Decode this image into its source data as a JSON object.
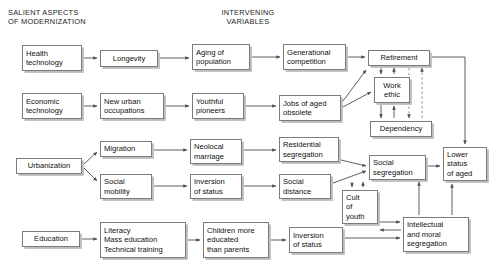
{
  "figure": {
    "type": "flowchart",
    "headers": [
      {
        "id": "salient",
        "text": "SALIENT ASPECTS\nOF MODERNIZATION",
        "x": 8,
        "y": 8,
        "align": "left"
      },
      {
        "id": "intervening",
        "text": "INTERVENING\nVARIABLES",
        "x": 196,
        "y": 8,
        "align": "center",
        "width": 104
      }
    ],
    "nodes": [
      {
        "id": "health-technology",
        "label": "Health\ntechnology",
        "x": 22,
        "y": 45,
        "w": 60,
        "h": 26,
        "align": "left",
        "column": "salient"
      },
      {
        "id": "longevity",
        "label": "Longevity",
        "x": 100,
        "y": 50,
        "w": 58,
        "h": 17,
        "align": "center",
        "column": "intervening"
      },
      {
        "id": "aging-of-population",
        "label": "Aging of\npopulation",
        "x": 192,
        "y": 44,
        "w": 58,
        "h": 26,
        "align": "left",
        "column": "intervening"
      },
      {
        "id": "generational-competition",
        "label": "Generational\ncompetition",
        "x": 283,
        "y": 44,
        "w": 63,
        "h": 26,
        "align": "left",
        "column": "intervening"
      },
      {
        "id": "retirement",
        "label": "Retirement",
        "x": 368,
        "y": 50,
        "w": 62,
        "h": 16,
        "align": "center",
        "column": "intervening"
      },
      {
        "id": "economic-technology",
        "label": "Economic\ntechnology",
        "x": 22,
        "y": 93,
        "w": 60,
        "h": 26,
        "align": "left",
        "column": "salient"
      },
      {
        "id": "new-urban-occupations",
        "label": "New urban\noccupations",
        "x": 100,
        "y": 93,
        "w": 64,
        "h": 26,
        "align": "left",
        "column": "intervening"
      },
      {
        "id": "youthful-pioneers",
        "label": "Youthful\npioneers",
        "x": 192,
        "y": 93,
        "w": 52,
        "h": 26,
        "align": "left",
        "column": "intervening"
      },
      {
        "id": "jobs-of-aged-obsolete",
        "label": "Jobs of aged\nobsolete",
        "x": 279,
        "y": 95,
        "w": 62,
        "h": 26,
        "align": "left",
        "column": "intervening"
      },
      {
        "id": "work-ethic",
        "label": "Work\nethic",
        "x": 374,
        "y": 77,
        "w": 36,
        "h": 26,
        "align": "center",
        "column": "intervening"
      },
      {
        "id": "dependency",
        "label": "Dependency",
        "x": 370,
        "y": 121,
        "w": 62,
        "h": 16,
        "align": "center",
        "column": "intervening"
      },
      {
        "id": "urbanization",
        "label": "Urbanization",
        "x": 16,
        "y": 158,
        "w": 66,
        "h": 16,
        "align": "center",
        "column": "salient"
      },
      {
        "id": "migration",
        "label": "Migration",
        "x": 100,
        "y": 141,
        "w": 52,
        "h": 16,
        "align": "left",
        "column": "intervening"
      },
      {
        "id": "neolocal-marriage",
        "label": "Neolocal\nmarriage",
        "x": 190,
        "y": 139,
        "w": 52,
        "h": 25,
        "align": "left",
        "column": "intervening"
      },
      {
        "id": "residential-segregation",
        "label": "Residential\nsegregation",
        "x": 279,
        "y": 137,
        "w": 60,
        "h": 25,
        "align": "left",
        "column": "intervening"
      },
      {
        "id": "social-segregation",
        "label": "Social\nsegregation",
        "x": 369,
        "y": 155,
        "w": 57,
        "h": 25,
        "align": "left",
        "column": "intervening"
      },
      {
        "id": "lower-status-of-aged",
        "label": "Lower\nstatus\nof aged",
        "x": 443,
        "y": 147,
        "w": 44,
        "h": 34,
        "align": "left",
        "column": "intervening"
      },
      {
        "id": "social-mobility",
        "label": "Social\nmobility",
        "x": 100,
        "y": 174,
        "w": 52,
        "h": 25,
        "align": "left",
        "column": "intervening"
      },
      {
        "id": "inversion-of-status-1",
        "label": "Inversion\nof status",
        "x": 190,
        "y": 174,
        "w": 52,
        "h": 25,
        "align": "left",
        "column": "intervening"
      },
      {
        "id": "social-distance",
        "label": "Social\ndistance",
        "x": 279,
        "y": 174,
        "w": 52,
        "h": 25,
        "align": "left",
        "column": "intervening"
      },
      {
        "id": "cult-of-youth",
        "label": "Cult\nof\nyouth",
        "x": 342,
        "y": 190,
        "w": 36,
        "h": 34,
        "align": "left",
        "column": "intervening"
      },
      {
        "id": "intellectual-moral-segregation",
        "label": "Intellectual\nand moral\nsegregation",
        "x": 403,
        "y": 217,
        "w": 66,
        "h": 35,
        "align": "left",
        "column": "intervening"
      },
      {
        "id": "education",
        "label": "Education",
        "x": 22,
        "y": 231,
        "w": 58,
        "h": 16,
        "align": "center",
        "column": "salient"
      },
      {
        "id": "literacy-block",
        "label": "Literacy\nMass education\nTechnical training",
        "x": 100,
        "y": 222,
        "w": 86,
        "h": 36,
        "align": "left",
        "column": "intervening"
      },
      {
        "id": "children-more-educated",
        "label": "Children more\neducated\nthan parents",
        "x": 203,
        "y": 222,
        "w": 66,
        "h": 36,
        "align": "left",
        "column": "intervening"
      },
      {
        "id": "inversion-of-status-2",
        "label": "Inversion\nof status",
        "x": 289,
        "y": 227,
        "w": 54,
        "h": 26,
        "align": "left",
        "column": "intervening"
      }
    ],
    "edges": [
      {
        "from": "health-technology",
        "to": "longevity",
        "style": "solid"
      },
      {
        "from": "longevity",
        "to": "aging-of-population",
        "style": "solid"
      },
      {
        "from": "aging-of-population",
        "to": "generational-competition",
        "style": "solid"
      },
      {
        "from": "generational-competition",
        "to": "retirement",
        "style": "solid"
      },
      {
        "from": "economic-technology",
        "to": "new-urban-occupations",
        "style": "solid"
      },
      {
        "from": "new-urban-occupations",
        "to": "youthful-pioneers",
        "style": "solid"
      },
      {
        "from": "youthful-pioneers",
        "to": "jobs-of-aged-obsolete",
        "style": "solid"
      },
      {
        "from": "jobs-of-aged-obsolete",
        "to": "retirement",
        "style": "solid"
      },
      {
        "from": "jobs-of-aged-obsolete",
        "to": "work-ethic",
        "style": "solid"
      },
      {
        "from": "retirement",
        "to": "work-ethic",
        "style": "solid"
      },
      {
        "from": "work-ethic",
        "to": "retirement",
        "style": "solid"
      },
      {
        "from": "work-ethic",
        "to": "dependency",
        "style": "solid"
      },
      {
        "from": "dependency",
        "to": "work-ethic",
        "style": "solid"
      },
      {
        "from": "retirement",
        "to": "dependency",
        "style": "dashed"
      },
      {
        "from": "dependency",
        "to": "retirement",
        "style": "dashed"
      },
      {
        "from": "retirement",
        "to": "lower-status-of-aged",
        "style": "solid"
      },
      {
        "from": "urbanization",
        "to": "migration",
        "style": "solid"
      },
      {
        "from": "urbanization",
        "to": "social-mobility",
        "style": "solid"
      },
      {
        "from": "migration",
        "to": "neolocal-marriage",
        "style": "solid"
      },
      {
        "from": "neolocal-marriage",
        "to": "residential-segregation",
        "style": "solid"
      },
      {
        "from": "residential-segregation",
        "to": "social-segregation",
        "style": "solid"
      },
      {
        "from": "social-mobility",
        "to": "inversion-of-status-1",
        "style": "solid"
      },
      {
        "from": "inversion-of-status-1",
        "to": "social-distance",
        "style": "solid"
      },
      {
        "from": "social-distance",
        "to": "social-segregation",
        "style": "solid"
      },
      {
        "from": "social-segregation",
        "to": "lower-status-of-aged",
        "style": "solid"
      },
      {
        "from": "social-segregation",
        "to": "cult-of-youth",
        "style": "solid"
      },
      {
        "from": "cult-of-youth",
        "to": "social-segregation",
        "style": "solid"
      },
      {
        "from": "cult-of-youth",
        "to": "intellectual-moral-segregation",
        "style": "solid"
      },
      {
        "from": "intellectual-moral-segregation",
        "to": "cult-of-youth",
        "style": "solid"
      },
      {
        "from": "intellectual-moral-segregation",
        "to": "social-segregation",
        "style": "solid"
      },
      {
        "from": "intellectual-moral-segregation",
        "to": "lower-status-of-aged",
        "style": "solid"
      },
      {
        "from": "education",
        "to": "literacy-block",
        "style": "solid"
      },
      {
        "from": "literacy-block",
        "to": "children-more-educated",
        "style": "solid"
      },
      {
        "from": "children-more-educated",
        "to": "inversion-of-status-2",
        "style": "solid"
      },
      {
        "from": "inversion-of-status-2",
        "to": "intellectual-moral-segregation",
        "style": "solid"
      }
    ],
    "colors": {
      "background": "#ffffff",
      "box_fill": "#ffffff",
      "box_border": "#7b7b7b",
      "box_shadow": "#969696",
      "text": "#101010",
      "connector": "#4d4d4d"
    }
  }
}
